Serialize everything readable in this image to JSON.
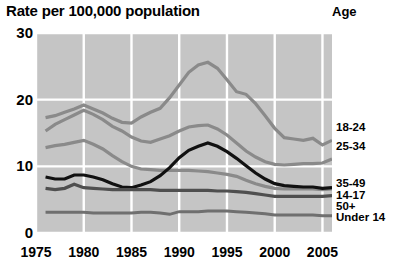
{
  "chart_data": {
    "type": "line",
    "title": "Rate per 100,000 population",
    "legend_title": "Age",
    "xlabel": "",
    "ylabel": "Rate per 100,000 population",
    "legend_position": "right",
    "grid": true,
    "xlim": [
      1975,
      2006
    ],
    "ylim": [
      0,
      30
    ],
    "yticks": [
      0,
      10,
      20,
      30
    ],
    "ytick_labels": [
      "0",
      "10",
      "20",
      "30"
    ],
    "xticks": [
      1975,
      1980,
      1985,
      1990,
      1995,
      2000,
      2005
    ],
    "xtick_labels": [
      "1975",
      "1980",
      "1985",
      "1990",
      "1995",
      "2000",
      "2005"
    ],
    "x": [
      1976,
      1977,
      1978,
      1979,
      1980,
      1981,
      1982,
      1983,
      1984,
      1985,
      1986,
      1987,
      1988,
      1989,
      1990,
      1991,
      1992,
      1993,
      1994,
      1995,
      1996,
      1997,
      1998,
      1999,
      2000,
      2001,
      2002,
      2003,
      2004,
      2005,
      2006
    ],
    "series": [
      {
        "name": "18-24",
        "color": "#8a8a8a",
        "width": 3.2,
        "values": [
          17.3,
          17.6,
          18.1,
          18.6,
          19.2,
          18.6,
          18.0,
          17.2,
          16.6,
          16.5,
          17.4,
          18.1,
          18.7,
          20.3,
          22.2,
          24.1,
          25.2,
          25.6,
          24.7,
          23.0,
          21.2,
          20.8,
          19.4,
          17.6,
          15.7,
          14.3,
          14.1,
          13.9,
          14.2,
          13.2,
          13.9
        ]
      },
      {
        "name": "25-34",
        "color": "#8a8a8a",
        "width": 3.2,
        "values": [
          15.3,
          16.3,
          17.0,
          17.7,
          18.4,
          17.8,
          17.0,
          16.0,
          15.3,
          14.4,
          13.8,
          13.6,
          14.1,
          14.6,
          15.3,
          15.9,
          16.1,
          16.2,
          15.6,
          14.7,
          13.5,
          12.3,
          11.4,
          10.7,
          10.3,
          10.2,
          10.3,
          10.4,
          10.4,
          10.5,
          11.1
        ]
      },
      {
        "name": "35-49",
        "color": "#8a8a8a",
        "width": 3.2,
        "values": [
          12.8,
          13.1,
          13.3,
          13.6,
          13.9,
          13.3,
          12.6,
          11.6,
          10.7,
          10.0,
          9.6,
          9.5,
          9.4,
          9.4,
          9.4,
          9.4,
          9.3,
          9.2,
          9.0,
          8.8,
          8.5,
          7.9,
          7.4,
          7.0,
          6.7,
          6.6,
          6.6,
          6.6,
          6.6,
          6.5,
          6.6
        ]
      },
      {
        "name": "14-17",
        "color": "#111111",
        "width": 3.2,
        "values": [
          8.4,
          8.1,
          8.1,
          8.7,
          8.7,
          8.4,
          8.0,
          7.4,
          6.9,
          6.8,
          7.2,
          7.7,
          8.6,
          9.8,
          11.3,
          12.4,
          13.0,
          13.5,
          13.0,
          12.2,
          11.2,
          10.1,
          9.0,
          8.1,
          7.4,
          7.1,
          7.0,
          6.9,
          6.9,
          6.7,
          6.8
        ]
      },
      {
        "name": "50+",
        "color": "#4f4f4f",
        "width": 3.2,
        "values": [
          6.7,
          6.5,
          6.7,
          7.3,
          6.8,
          6.7,
          6.6,
          6.5,
          6.5,
          6.5,
          6.5,
          6.5,
          6.4,
          6.4,
          6.4,
          6.4,
          6.4,
          6.4,
          6.3,
          6.3,
          6.2,
          6.1,
          5.9,
          5.7,
          5.5,
          5.5,
          5.5,
          5.5,
          5.5,
          5.5,
          5.6
        ]
      },
      {
        "name": "Under 14",
        "color": "#6f6f6f",
        "width": 3.0,
        "values": [
          3.1,
          3.1,
          3.1,
          3.1,
          3.1,
          3.0,
          3.0,
          3.0,
          3.0,
          3.0,
          3.1,
          3.1,
          3.0,
          2.8,
          3.2,
          3.2,
          3.2,
          3.3,
          3.3,
          3.3,
          3.2,
          3.1,
          3.0,
          2.9,
          2.7,
          2.7,
          2.7,
          2.7,
          2.7,
          2.6,
          2.6
        ]
      }
    ],
    "legend_entries": [
      {
        "label": "18-24",
        "y": 122
      },
      {
        "label": "25-34",
        "y": 141
      },
      {
        "label": "35-49",
        "y": 178
      },
      {
        "label": "14-17",
        "y": 190
      },
      {
        "label": "50+",
        "y": 201
      },
      {
        "label": "Under 14",
        "y": 212
      }
    ],
    "colors": {
      "plot_background": "#c5c5c5",
      "gridline": "#ffffff",
      "page_background": "#ffffff",
      "text": "#000000"
    }
  }
}
